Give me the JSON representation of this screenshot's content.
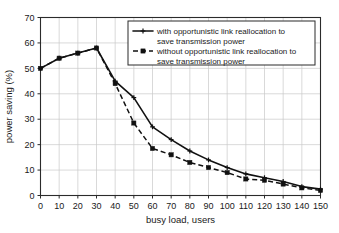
{
  "chart_data": {
    "type": "line",
    "title": "",
    "subtitle": "",
    "xlabel": "busy load, users",
    "ylabel": "power saving (%)",
    "xlim": [
      0,
      150
    ],
    "ylim": [
      0,
      70
    ],
    "xticks": [
      0,
      10,
      20,
      30,
      40,
      50,
      60,
      70,
      80,
      90,
      100,
      110,
      120,
      130,
      140,
      150
    ],
    "yticks": [
      0,
      10,
      20,
      30,
      40,
      50,
      60,
      70
    ],
    "xtick_labels": [
      "0",
      "10",
      "20",
      "30",
      "40",
      "50",
      "60",
      "70",
      "80",
      "90",
      "100",
      "110",
      "120",
      "130",
      "140",
      "150"
    ],
    "ytick_labels": [
      "0",
      "10",
      "20",
      "30",
      "40",
      "50",
      "60",
      "70"
    ],
    "grid": true,
    "legend_position": "top-right-inside",
    "x": [
      0,
      10,
      20,
      30,
      40,
      50,
      60,
      70,
      80,
      90,
      100,
      110,
      120,
      130,
      140,
      150
    ],
    "series": [
      {
        "name": "with opportunistic link reallocation to save transmission power",
        "style": "solid",
        "marker": "plus",
        "color": "#111111",
        "values": [
          50,
          54,
          56,
          58,
          45,
          38.5,
          27,
          22,
          17.5,
          14,
          11,
          8.5,
          7,
          5.5,
          3.5,
          2.5
        ]
      },
      {
        "name": "without opportunistic link reallocation to save transmission power",
        "style": "dashed",
        "marker": "square",
        "color": "#111111",
        "values": [
          50,
          54,
          56,
          58,
          44,
          28.5,
          18.5,
          16,
          13,
          11,
          9,
          6.5,
          6,
          4.5,
          3,
          2
        ]
      }
    ]
  },
  "legend": {
    "entry1_line1": "with opportunistic link reallocation to",
    "entry1_line2": "save transmission power",
    "entry2_line1": "without opportunistic link reallocation to",
    "entry2_line2": "save transmission power"
  },
  "axes": {
    "x_title": "busy load, users",
    "y_title": "power saving (%)"
  }
}
